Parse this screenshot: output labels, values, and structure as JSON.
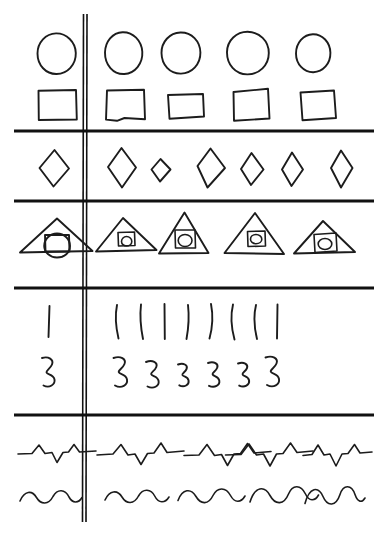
{
  "document": {
    "title": "Hand-drawn shape repetition sheet",
    "medium": "pen on white paper",
    "ink_color": "#1c1c1c",
    "paper_color": "#ffffff",
    "width": 388,
    "height": 535,
    "description": "A hand-drawn grid: a vertical rule near the left separates a single prototype glyph column from a row of repeated hand-copied glyphs; five horizontal rules divide the sheet into bands."
  },
  "rules": {
    "vertical": {
      "name": "vertical-divider",
      "x": 85,
      "y_start": 14,
      "y_end": 522,
      "double_line": true
    },
    "horizontal": [
      {
        "name": "rule-1",
        "y": 131,
        "x_start": 14,
        "x_end": 374
      },
      {
        "name": "rule-2",
        "y": 201,
        "x_start": 14,
        "x_end": 374
      },
      {
        "name": "rule-3",
        "y": 288,
        "x_start": 14,
        "x_end": 374
      },
      {
        "name": "rule-4",
        "y": 415,
        "x_start": 14,
        "x_end": 374
      }
    ]
  },
  "bands": [
    {
      "index": 1,
      "name": "band-circles-and-squares",
      "rows": [
        {
          "name": "row-circles",
          "glyph": "circle",
          "prototype_count": 1,
          "repetition_count": 4,
          "total_count": 5
        },
        {
          "name": "row-squares",
          "glyph": "square",
          "prototype_count": 1,
          "repetition_count": 4,
          "total_count": 5
        }
      ]
    },
    {
      "index": 2,
      "name": "band-diamonds",
      "rows": [
        {
          "name": "row-diamonds",
          "glyph": "diamond",
          "prototype_count": 1,
          "repetition_count": 6,
          "total_count": 7
        }
      ]
    },
    {
      "index": 3,
      "name": "band-triangles",
      "rows": [
        {
          "name": "row-triangles",
          "glyph": "triangle-with-square-and-circle",
          "prototype_count": 1,
          "repetition_count": 4,
          "total_count": 5
        }
      ]
    },
    {
      "index": 4,
      "name": "band-strokes-and-threes",
      "rows": [
        {
          "name": "row-vertical-strokes",
          "glyph": "vertical-stroke",
          "prototype_count": 1,
          "repetition_count": 8,
          "total_count": 9
        },
        {
          "name": "row-threes",
          "glyph": "numeral-three",
          "prototype_count": 1,
          "repetition_count": 6,
          "total_count": 7
        }
      ]
    },
    {
      "index": 5,
      "name": "band-zigzags-and-waves",
      "rows": [
        {
          "name": "row-zigzags",
          "glyph": "zigzag-peak-trough",
          "prototype_count": 1,
          "repetition_count": 4,
          "total_count": 5
        },
        {
          "name": "row-waves",
          "glyph": "sine-wave",
          "prototype_count": 1,
          "repetition_count": 4,
          "total_count": 5
        }
      ]
    }
  ],
  "glyph_paths": {
    "circles": [
      "M 37.5 53.5 C 37.5 42.2 45.8 33.6 56.0 33.4 C 66.5 33.2 75.5 42.0 75.8 53.0 C 76.1 64.6 67.4 73.8 56.6 74.0 C 46.0 74.2 37.5 65.3 37.5 53.5 Z",
      "M 105.0 52.5 C 105.2 41.5 112.5 32.6 122.5 32.2 C 133.0 31.8 141.6 40.6 142.3 51.8 C 143.0 63.4 135.0 73.5 124.3 74.0 C 113.2 74.5 104.8 64.8 105.0 52.5 Z",
      "M 161.5 53.0 C 161.3 42.0 169.6 32.8 180.4 32.5 C 191.6 32.2 200.2 41.2 200.4 52.6 C 200.6 64.2 192.0 73.4 181.0 73.6 C 169.8 73.8 161.7 65.0 161.5 53.0 Z",
      "M 227.0 52.0 C 227.2 40.4 236.5 31.8 247.5 31.8 C 259.5 31.8 268.8 41.0 268.8 53.0 C 268.8 65.2 259.2 74.6 247.2 74.4 C 235.4 74.2 226.8 64.6 227.0 52.0 Z",
      "M 296.0 53.5 C 296.0 43.0 303.6 34.4 312.8 34.2 C 322.4 34.0 330.2 42.4 330.4 52.8 C 330.6 63.6 323.0 72.0 313.4 72.2 C 303.8 72.4 296.0 64.2 296.0 53.5 Z"
    ],
    "squares": [
      "M 38.5 90.8 L 76.0 90.0 L 76.8 119.5 L 38.8 120.0 Z",
      "M 107.0 90.5 L 144.0 89.8 L 145.0 119.2 L 124.5 118.0 L 117.0 120.8 L 106.0 119.6 Z",
      "M 168.0 95.0 L 203.0 94.0 L 204.0 116.5 L 169.5 118.8 Z",
      "M 233.5 92.0 L 268.0 88.8 L 269.5 118.5 L 234.0 120.8 Z",
      "M 300.5 92.5 L 334.0 90.5 L 336.0 118.0 L 302.5 120.2 Z"
    ],
    "diamonds": [
      "M 54.5 150.0 L 69.0 168.5 L 53.5 186.5 L 39.5 168.0 Z",
      "M 121.5 148.0 L 136.0 167.5 L 122.0 187.5 L 108.0 167.0 Z",
      "M 160.5 159.0 L 170.5 169.5 L 160.0 181.5 L 151.5 169.5 Z",
      "M 210.5 148.5 L 225.0 168.0 L 207.5 187.5 L 197.5 166.0 Z",
      "M 251.5 153.0 L 263.5 169.5 L 251.0 185.0 L 241.0 169.0 Z",
      "M 292.0 152.5 L 303.0 169.5 L 291.5 186.0 L 282.0 169.5 Z",
      "M 341.0 150.5 L 352.5 168.0 L 341.0 187.5 L 331.0 168.0 Z"
    ],
    "triangles": [
      {
        "outer": "M 57.0 218.5 L 92.5 251.0 L 20.0 252.5 Z",
        "square": "M 45.0 235.0 L 69.0 235.0 L 69.5 251.5 L 45.5 251.5 Z",
        "circle": "M 57.0 233.5 C 64.5 233.5 70.0 239.2 70.0 246.0 C 70.0 252.5 64.5 257.5 57.0 257.5 C 49.8 257.5 44.2 252.2 44.2 246.0 C 44.2 239.4 49.8 233.5 57.0 233.5 Z"
      },
      {
        "outer": "M 123.0 218.0 L 156.5 250.0 L 96.0 251.5 Z",
        "square": "M 118.0 232.5 L 134.5 232.0 L 135.0 245.5 L 118.5 246.0 Z",
        "circle": "M 126.5 236.5 C 129.5 236.5 131.8 238.8 131.8 241.5 C 131.8 244.0 129.5 246.0 126.5 246.0 C 123.8 246.0 121.5 244.0 121.5 241.5 C 121.5 238.8 123.8 236.5 126.5 236.5 Z"
      },
      {
        "outer": "M 184.5 212.5 L 208.5 253.0 L 159.0 253.5 Z",
        "square": "M 175.0 230.0 L 195.0 230.0 L 195.5 248.0 L 175.5 248.0 Z",
        "circle": "M 185.0 234.5 C 189.0 234.5 192.0 237.2 192.0 240.5 C 192.0 243.8 189.0 246.5 185.0 246.5 C 181.2 246.5 178.2 243.8 178.2 240.5 C 178.2 237.2 181.2 234.5 185.0 234.5 Z"
      },
      {
        "outer": "M 255.0 213.0 L 284.0 254.0 L 224.5 253.0 Z",
        "square": "M 247.5 231.5 L 265.0 231.0 L 265.5 246.0 L 248.0 246.5 Z",
        "circle": "M 256.0 234.5 C 259.2 234.5 261.8 236.6 261.8 239.2 C 261.8 241.8 259.2 243.8 256.0 243.8 C 252.8 243.8 250.5 241.8 250.5 239.2 C 250.5 236.6 252.8 234.5 256.0 234.5 Z"
      },
      {
        "outer": "M 323.0 221.0 L 355.0 252.0 L 294.0 253.5 Z",
        "square": "M 314.0 234.5 L 336.0 233.0 L 337.0 251.0 L 315.0 252.5 Z",
        "circle": "M 325.0 238.5 C 328.8 238.5 331.8 241.0 331.8 244.0 C 331.8 247.0 328.8 249.5 325.0 249.5 C 321.2 249.5 318.2 247.0 318.2 244.0 C 318.2 241.0 321.2 238.5 325.0 238.5 Z"
      }
    ],
    "strokes": [
      "M 49.5 306.0 L 48.5 337.0",
      "M 117.0 305.0 C 115.0 315.0 115.8 327.0 118.5 338.5",
      "M 141.0 304.5 C 139.8 315.0 140.6 327.0 143.0 339.0",
      "M 164.5 304.0 L 164.8 339.0",
      "M 188.0 305.0 C 189.2 315.5 188.6 327.5 186.5 339.0",
      "M 211.0 304.0 C 213.2 315.0 212.6 327.0 209.5 338.5",
      "M 233.0 304.5 C 230.5 315.0 231.2 327.5 234.5 339.5",
      "M 256.0 305.0 C 253.5 315.5 254.2 327.5 257.0 339.0",
      "M 277.5 304.5 L 277.0 338.5"
    ],
    "threes": [
      "M 42.0 358.0 C 48.5 356.0 54.0 359.5 52.0 364.5 C 50.3 368.8 45.8 370.5 46.5 372.5 C 47.3 374.8 53.5 374.0 54.5 379.5 C 55.4 384.5 49.5 388.5 43.5 385.5",
      "M 113.5 358.0 C 120.5 355.5 126.5 359.0 124.5 364.0 C 122.8 368.5 118.0 370.0 118.8 372.2 C 119.6 374.6 126.0 374.0 127.0 379.5 C 128.0 385.0 121.5 389.0 115.0 385.5",
      "M 146.0 362.0 C 152.5 359.5 158.0 362.5 156.3 367.0 C 154.8 371.0 150.5 372.3 151.2 374.3 C 152.0 376.5 157.8 376.0 158.6 381.0 C 159.4 386.0 153.5 389.5 147.5 386.5",
      "M 178.0 364.5 C 183.5 362.5 188.0 365.0 186.6 368.8 C 185.4 372.2 181.8 373.2 182.4 375.0 C 183.1 376.8 188.0 376.4 188.6 380.6 C 189.3 384.8 184.3 387.8 179.3 385.3",
      "M 208.0 363.0 C 214.0 361.0 218.8 363.8 217.2 367.8 C 215.9 371.4 211.9 372.5 212.6 374.4 C 213.3 376.4 218.6 376.0 219.3 380.6 C 220.1 385.2 214.6 388.5 209.0 385.8",
      "M 238.0 363.5 C 243.8 361.5 248.5 364.2 247.0 368.2 C 245.7 371.6 241.9 372.6 242.6 374.5 C 243.3 376.5 248.4 376.1 249.1 380.5 C 249.8 384.9 244.5 388.2 239.2 385.6",
      "M 265.5 357.5 C 272.5 355.0 278.5 358.5 276.5 363.5 C 274.8 368.0 270.0 369.5 270.8 371.7 C 271.6 374.1 278.0 373.5 279.0 379.0 C 280.0 384.5 273.5 388.5 267.0 385.0"
    ],
    "zigzags": [
      "M 18.0 454.0 L 32.0 453.5 L 39.0 445.0 L 45.0 453.5 L 52.0 452.5 L 57.0 462.5 L 63.0 452.5 L 68.5 452.0 L 74.0 444.5 L 79.5 452.0 L 96.0 451.0",
      "M 97.0 455.0 L 113.0 454.0 L 121.0 444.5 L 128.0 455.0 L 135.0 454.0 L 141.0 464.5 L 147.5 453.5 L 154.0 453.0 L 161.0 443.0 L 167.0 452.5 L 184.0 451.0",
      "M 184.0 455.5 L 199.0 455.0 L 207.0 444.5 L 214.5 455.5 L 221.5 454.5 L 227.5 465.5 L 234.0 454.0 L 240.5 453.5 L 247.5 443.5 L 254.0 453.0 L 271.0 451.5",
      "M 225.5 455.0 L 241.0 454.5 L 249.0 444.0 L 256.5 455.0 L 263.5 454.0 L 270.0 466.0 L 276.5 454.0 L 283.0 453.5 L 290.5 443.0 L 297.0 452.5 L 313.0 451.0",
      "M 303.0 455.5 L 312.0 454.5 L 318.0 445.0 L 324.0 455.0 L 330.0 454.0 L 336.0 466.0 L 342.0 454.0 L 348.0 453.5 L 354.5 444.5 L 360.0 453.0 L 372.0 452.0"
    ],
    "waves": [
      "M 20.0 501.0 C 24.5 490.5 32.0 490.0 36.5 497.5 C 41.0 505.0 48.5 505.0 53.0 496.5 C 57.5 488.5 65.0 489.0 69.0 497.0 C 72.5 503.5 78.5 503.5 82.0 497.5",
      "M 105.0 500.0 C 109.5 490.0 117.5 489.5 122.0 497.0 C 126.5 504.5 134.0 504.5 138.5 496.0 C 143.0 488.0 151.0 488.5 155.0 496.5 C 158.5 503.5 165.0 503.5 169.0 497.0",
      "M 178.0 500.5 C 182.5 488.5 191.0 488.0 196.0 496.5 C 200.8 504.8 208.5 504.8 213.0 495.5 C 217.5 486.5 226.0 487.0 230.5 495.5 C 234.5 503.0 241.0 503.0 245.0 496.0",
      "M 250.0 502.0 C 255.0 486.0 264.5 485.5 270.0 495.5 C 275.5 505.5 284.0 505.0 288.5 494.0 C 292.5 484.0 301.0 484.5 305.5 494.0 C 309.0 501.5 315.0 501.5 318.5 495.0",
      "M 305.0 503.5 C 309.5 486.5 318.5 486.0 323.0 496.5 C 327.5 507.0 336.0 506.5 340.0 494.5 C 343.5 484.0 351.5 484.5 355.0 494.5 C 357.8 502.5 362.0 503.0 365.0 498.0"
    ]
  }
}
